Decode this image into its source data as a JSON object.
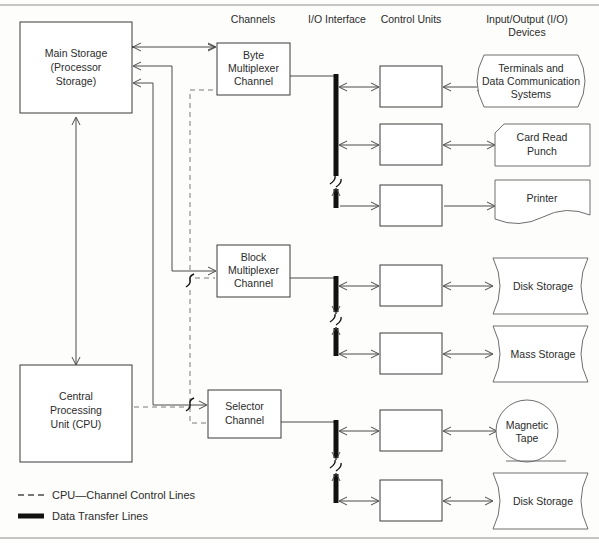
{
  "figure": {
    "background_color": "#fdfdfc",
    "line_color": "#4a4a4a",
    "bus_color": "#111111"
  },
  "column_headers": [
    {
      "id": "channels",
      "label": "Channels",
      "x": 253,
      "y": 23
    },
    {
      "id": "io-interface",
      "label": "I/O Interface",
      "x": 337,
      "y": 23
    },
    {
      "id": "control-units",
      "label": "Control Units",
      "x": 411,
      "y": 23
    },
    {
      "id": "io-devices-line1",
      "label": "Input/Output (I/O)",
      "x": 527,
      "y": 23
    },
    {
      "id": "io-devices-line2",
      "label": "Devices",
      "x": 527,
      "y": 35
    }
  ],
  "processor_boxes": [
    {
      "id": "main-storage",
      "lines": [
        "Main Storage",
        "(Processor",
        "Storage)"
      ],
      "x": 20,
      "y": 22,
      "w": 112,
      "h": 91
    },
    {
      "id": "cpu",
      "lines": [
        "Central",
        "Processing",
        "Unit (CPU)"
      ],
      "x": 20,
      "y": 365,
      "w": 112,
      "h": 97
    }
  ],
  "channels": [
    {
      "id": "byte-multiplexer-channel",
      "lines": [
        "Byte",
        "Multiplexer",
        "Channel"
      ],
      "x": 217,
      "y": 43,
      "w": 73,
      "h": 52
    },
    {
      "id": "block-multiplexer-channel",
      "lines": [
        "Block",
        "Multiplexer",
        "Channel"
      ],
      "x": 217,
      "y": 245,
      "w": 73,
      "h": 52
    },
    {
      "id": "selector-channel",
      "lines": [
        "Selector",
        "Channel"
      ],
      "x": 208,
      "y": 390,
      "w": 73,
      "h": 48
    }
  ],
  "control_units": [
    {
      "id": "control-unit-1",
      "x": 380,
      "y": 66,
      "w": 62,
      "h": 41
    },
    {
      "id": "control-unit-2",
      "x": 380,
      "y": 124,
      "w": 62,
      "h": 41
    },
    {
      "id": "control-unit-3",
      "x": 380,
      "y": 185,
      "w": 62,
      "h": 41
    },
    {
      "id": "control-unit-4",
      "x": 380,
      "y": 265,
      "w": 62,
      "h": 41
    },
    {
      "id": "control-unit-5",
      "x": 380,
      "y": 333,
      "w": 62,
      "h": 41
    },
    {
      "id": "control-unit-6",
      "x": 380,
      "y": 410,
      "w": 62,
      "h": 41
    },
    {
      "id": "control-unit-7",
      "x": 380,
      "y": 480,
      "w": 62,
      "h": 41
    }
  ],
  "io_devices": [
    {
      "id": "terminals-and-data-communication-systems",
      "shape": "terminal",
      "lines": [
        "Terminals and",
        "Data Communication",
        "Systems"
      ],
      "x": 470,
      "y": 55,
      "w": 120,
      "h": 52
    },
    {
      "id": "card-read-punch",
      "shape": "punched-card",
      "lines": [
        "Card Read",
        "Punch"
      ],
      "x": 495,
      "y": 124,
      "w": 95,
      "h": 42
    },
    {
      "id": "printer",
      "shape": "document",
      "lines": [
        "Printer"
      ],
      "x": 495,
      "y": 180,
      "w": 95,
      "h": 47
    },
    {
      "id": "disk-storage-1",
      "shape": "cylinder",
      "lines": [
        "Disk Storage"
      ],
      "x": 490,
      "y": 258,
      "w": 100,
      "h": 56
    },
    {
      "id": "mass-storage",
      "shape": "cylinder",
      "lines": [
        "Mass Storage"
      ],
      "x": 490,
      "y": 326,
      "w": 100,
      "h": 56
    },
    {
      "id": "magnetic-tape",
      "shape": "circle",
      "lines": [
        "Magnetic",
        "Tape"
      ],
      "x": 495,
      "y": 402,
      "w": 62,
      "h": 62
    },
    {
      "id": "disk-storage-2",
      "shape": "cylinder",
      "lines": [
        "Disk Storage"
      ],
      "x": 490,
      "y": 473,
      "w": 100,
      "h": 56
    }
  ],
  "legend": {
    "items": [
      {
        "id": "cpu-channel-control-lines",
        "style": "dashed",
        "label": "CPU—Channel Control Lines",
        "y": 495
      },
      {
        "id": "data-transfer-lines",
        "style": "thick-solid",
        "label": "Data Transfer Lines",
        "y": 516
      }
    ]
  },
  "buses": [
    {
      "id": "bus-byte-multiplexer",
      "x": 336,
      "top": 76,
      "break_y": 180,
      "bottom": 206
    },
    {
      "id": "bus-block-multiplexer",
      "x": 336,
      "top": 278,
      "break_y": 320,
      "bottom": 354
    },
    {
      "id": "bus-selector",
      "x": 336,
      "top": 422,
      "break_y": 466,
      "bottom": 501
    }
  ]
}
